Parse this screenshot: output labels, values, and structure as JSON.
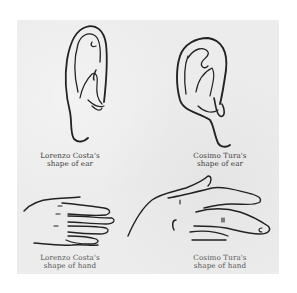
{
  "figure": {
    "panels": [
      {
        "id": "costa-ear",
        "subject": "ear",
        "caption_line1": "Lorenzo Costa's",
        "caption_line2": "shape of ear"
      },
      {
        "id": "tura-ear",
        "subject": "ear",
        "caption_line1": "Cosimo Tura's",
        "caption_line2": "shape of ear"
      },
      {
        "id": "costa-hand",
        "subject": "hand",
        "caption_line1": "Lorenzo Costa's",
        "caption_line2": "shape of hand"
      },
      {
        "id": "tura-hand",
        "subject": "hand",
        "caption_line1": "Cosimo Tura's",
        "caption_line2": "shape of hand"
      }
    ],
    "colors": {
      "background": "#ffffff",
      "plate": "#ececec",
      "ink": "#222222"
    }
  }
}
